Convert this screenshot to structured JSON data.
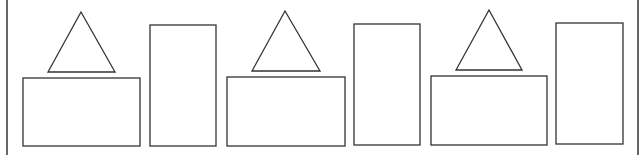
{
  "diagram": {
    "stroke_color": "#333333",
    "background": "#ffffff",
    "border_lines": [
      {
        "name": "left-border-line",
        "x": 7,
        "y1": 0,
        "y2": 155
      },
      {
        "name": "right-border-line",
        "x": 638,
        "y1": 0,
        "y2": 155
      }
    ],
    "groups": [
      {
        "triangle": {
          "points": "81,12 48,72 115,72"
        },
        "wide_rect": {
          "x": 23,
          "y": 78,
          "w": 117,
          "h": 68
        },
        "tall_rect": {
          "x": 150,
          "y": 25,
          "w": 66,
          "h": 121
        }
      },
      {
        "triangle": {
          "points": "285,11 252,71 320,71"
        },
        "wide_rect": {
          "x": 227,
          "y": 77,
          "w": 118,
          "h": 69
        },
        "tall_rect": {
          "x": 354,
          "y": 24,
          "w": 66,
          "h": 121
        }
      },
      {
        "triangle": {
          "points": "489,10 456,70 522,70"
        },
        "wide_rect": {
          "x": 431,
          "y": 76,
          "w": 116,
          "h": 69
        },
        "tall_rect": {
          "x": 556,
          "y": 23,
          "w": 67,
          "h": 121
        }
      }
    ]
  }
}
